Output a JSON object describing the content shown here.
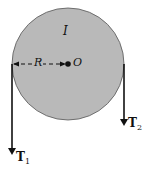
{
  "diagram": {
    "disk": {
      "label": "I",
      "center_label": "O",
      "radius_label": "R",
      "fill": "#b9b9b9"
    },
    "ropes": [
      {
        "tension": "T",
        "subscript": "1"
      },
      {
        "tension": "T",
        "subscript": "2"
      }
    ]
  }
}
